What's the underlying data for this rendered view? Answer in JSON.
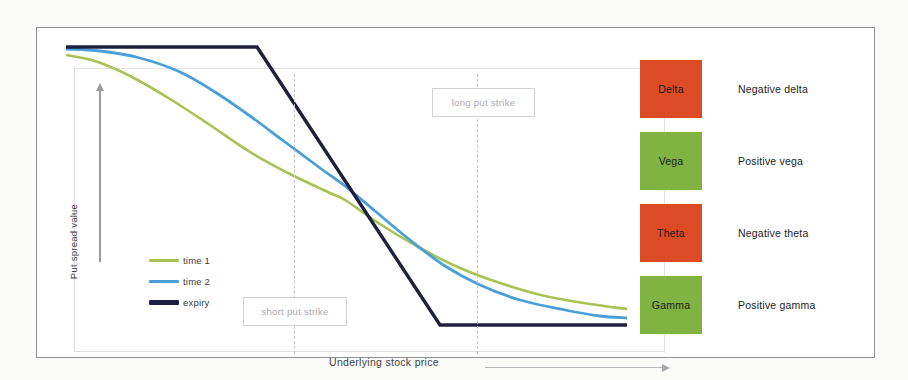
{
  "figure": {
    "background_color": "#fbfbfa",
    "frame_border_color": "#8d9196"
  },
  "chart_data": {
    "type": "line",
    "title": "",
    "xlabel": "Underlying stock price",
    "ylabel": "Put spread value",
    "grid": false,
    "legend_position": "inside-left",
    "axis_ticks_shown": false,
    "xlim": [
      0,
      100
    ],
    "ylim": [
      0,
      100
    ],
    "annotations": [
      {
        "id": "short-put-strike",
        "label": "short put strike",
        "x_pixel": 257,
        "type": "vertical-dashed-line"
      },
      {
        "id": "long-put-strike",
        "label": "long put strike",
        "x_pixel": 440,
        "type": "vertical-dashed-line"
      }
    ],
    "series": [
      {
        "name": "time 1",
        "color": "#a9c255",
        "width": 2.6,
        "points": [
          [
            66,
            55
          ],
          [
            95,
            61
          ],
          [
            130,
            76
          ],
          [
            170,
            99
          ],
          [
            210,
            125
          ],
          [
            250,
            152
          ],
          [
            290,
            174
          ],
          [
            330,
            193
          ],
          [
            345,
            200
          ],
          [
            380,
            224
          ],
          [
            420,
            248
          ],
          [
            460,
            268
          ],
          [
            500,
            283
          ],
          [
            545,
            296
          ],
          [
            590,
            304
          ],
          [
            627,
            309
          ]
        ]
      },
      {
        "name": "time 2",
        "color": "#4a9fd8",
        "width": 2.8,
        "points": [
          [
            66,
            49
          ],
          [
            100,
            51
          ],
          [
            140,
            58
          ],
          [
            180,
            72
          ],
          [
            215,
            92
          ],
          [
            250,
            116
          ],
          [
            285,
            142
          ],
          [
            320,
            168
          ],
          [
            345,
            186
          ],
          [
            375,
            211
          ],
          [
            410,
            240
          ],
          [
            445,
            266
          ],
          [
            480,
            285
          ],
          [
            520,
            300
          ],
          [
            565,
            310
          ],
          [
            600,
            316
          ],
          [
            627,
            318
          ]
        ]
      },
      {
        "name": "expiry",
        "color": "#1f1f40",
        "width": 3.4,
        "points": [
          [
            66,
            47
          ],
          [
            257,
            47
          ],
          [
            440,
            325
          ],
          [
            627,
            325
          ]
        ]
      }
    ],
    "legend_entries": [
      {
        "label": "time 1",
        "color": "#a9c255"
      },
      {
        "label": "time 2",
        "color": "#4a9fd8"
      },
      {
        "label": "expiry",
        "color": "#1f1f40"
      }
    ]
  },
  "greeks": {
    "items": [
      {
        "name": "Delta",
        "description": "Negative delta",
        "color": "#dc4b26",
        "sign": "negative"
      },
      {
        "name": "Vega",
        "description": "Positive vega",
        "color": "#81b342",
        "sign": "positive"
      },
      {
        "name": "Theta",
        "description": "Negative theta",
        "color": "#dc4b26",
        "sign": "negative"
      },
      {
        "name": "Gamma",
        "description": "Positive gamma",
        "color": "#81b342",
        "sign": "positive"
      }
    ]
  }
}
